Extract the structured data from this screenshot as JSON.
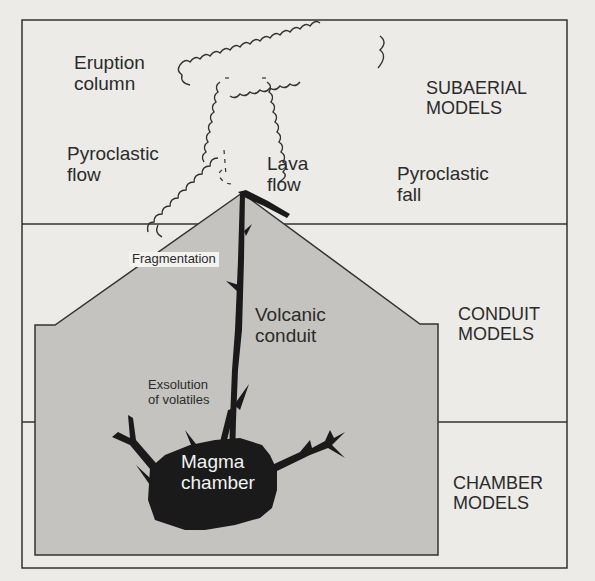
{
  "diagram": {
    "sections": [
      {
        "name": "subaerial",
        "label_line1": "SUBAERIAL",
        "label_line2": "MODELS"
      },
      {
        "name": "conduit",
        "label_line1": "CONDUIT",
        "label_line2": "MODELS"
      },
      {
        "name": "chamber",
        "label_line1": "CHAMBER",
        "label_line2": "MODELS"
      }
    ],
    "labels": {
      "eruption_column": {
        "line1": "Eruption",
        "line2": "column"
      },
      "pyroclastic_flow": {
        "line1": "Pyroclastic",
        "line2": "flow"
      },
      "lava_flow": {
        "line1": "Lava",
        "line2": "flow"
      },
      "pyroclastic_fall": {
        "line1": "Pyroclastic",
        "line2": "fall"
      },
      "fragmentation": "Fragmentation",
      "volcanic_conduit": {
        "line1": "Volcanic",
        "line2": "conduit"
      },
      "exsolution": {
        "line1": "Exsolution",
        "line2": "of volatiles"
      },
      "magma_chamber": {
        "line1": "Magma",
        "line2": "chamber"
      }
    },
    "colors": {
      "background": "#ecebe8",
      "volcano_fill": "#c4c3c0",
      "magma": "#1a1a1a",
      "lines": "#333333"
    }
  }
}
